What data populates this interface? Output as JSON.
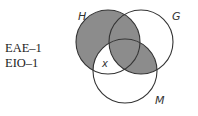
{
  "syllogism_forms": [
    "EAE–1",
    "EIO–1"
  ],
  "diagram": {
    "type": "venn-3",
    "circles": [
      {
        "label": "H",
        "cx": 108,
        "cy": 42,
        "r": 32
      },
      {
        "label": "G",
        "cx": 141,
        "cy": 42,
        "r": 32
      },
      {
        "label": "M",
        "cx": 125,
        "cy": 71,
        "r": 32
      }
    ],
    "shaded_regions": [
      "H only",
      "H∩G only",
      "H∩G∩M",
      "G∩M only"
    ],
    "marker": {
      "symbol": "x",
      "region": "H∩M only"
    },
    "shade_color": "#8c8c8c",
    "stroke_color": "#333333"
  }
}
